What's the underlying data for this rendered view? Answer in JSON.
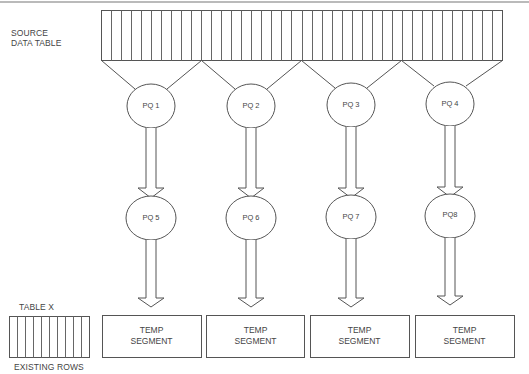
{
  "diagram": {
    "source_table": {
      "label_line1": "SOURCE",
      "label_line2": "DATA TABLE",
      "columns": 40
    },
    "query_servers_row1": [
      {
        "id": "pq1",
        "label": "PQ 1"
      },
      {
        "id": "pq2",
        "label": "PQ 2"
      },
      {
        "id": "pq3",
        "label": "PQ 3"
      },
      {
        "id": "pq4",
        "label": "PQ 4"
      }
    ],
    "query_servers_row2": [
      {
        "id": "pq5",
        "label": "PQ 5"
      },
      {
        "id": "pq6",
        "label": "PQ 6"
      },
      {
        "id": "pq7",
        "label": "PQ 7"
      },
      {
        "id": "pq8",
        "label": "PQ8"
      }
    ],
    "temp_segments": [
      {
        "line1": "TEMP",
        "line2": "SEGMENT"
      },
      {
        "line1": "TEMP",
        "line2": "SEGMENT"
      },
      {
        "line1": "TEMP",
        "line2": "SEGMENT"
      },
      {
        "line1": "TEMP",
        "line2": "SEGMENT"
      }
    ],
    "table_x": {
      "title": "TABLE X",
      "caption": "EXISTING ROWS",
      "columns": 10
    },
    "colors": {
      "stroke": "#555555",
      "background": "#ffffff"
    }
  }
}
